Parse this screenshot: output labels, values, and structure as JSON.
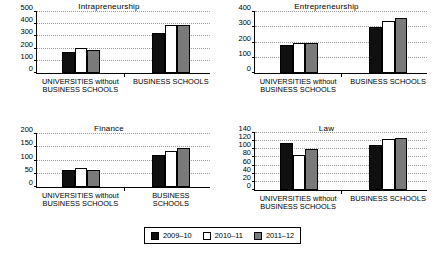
{
  "legend": {
    "items": [
      {
        "label": "2009–10",
        "color": "#101010"
      },
      {
        "label": "2010–11",
        "color": "#ffffff"
      },
      {
        "label": "2011–12",
        "color": "#7a7a7a"
      }
    ]
  },
  "chart_data": [
    {
      "type": "bar",
      "title": "Intrapreneurship",
      "categories": [
        "UNIVERSITIES without\nBUSINESS SCHOOLS",
        "BUSINESS SCHOOLS"
      ],
      "series": [
        {
          "name": "2009–10",
          "values": [
            175,
            330
          ]
        },
        {
          "name": "2010–11",
          "values": [
            207,
            395
          ]
        },
        {
          "name": "2011–12",
          "values": [
            188,
            395
          ]
        }
      ],
      "xlabel": "",
      "ylabel": "",
      "ylim": [
        0,
        500
      ],
      "yticks": [
        0,
        100,
        200,
        300,
        400,
        500
      ],
      "grid": true,
      "legend_position": "bottom-center"
    },
    {
      "type": "bar",
      "title": "Entrepreneurship",
      "categories": [
        "UNIVERSITIES without\nBUSINESS SCHOOLS",
        "BUSINESS SCHOOLS"
      ],
      "series": [
        {
          "name": "2009–10",
          "values": [
            183,
            303
          ]
        },
        {
          "name": "2010–11",
          "values": [
            198,
            338
          ]
        },
        {
          "name": "2011–12",
          "values": [
            197,
            362
          ]
        }
      ],
      "xlabel": "",
      "ylabel": "",
      "ylim": [
        0,
        400
      ],
      "yticks": [
        0,
        100,
        200,
        300,
        400
      ],
      "grid": true,
      "legend_position": "bottom-center"
    },
    {
      "type": "bar",
      "title": "Finance",
      "categories": [
        "UNIVERSITIES without\nBUSINESS SCHOOLS",
        "BUSINESS\nSCHOOLS"
      ],
      "series": [
        {
          "name": "2009–10",
          "values": [
            66,
            120
          ]
        },
        {
          "name": "2010–11",
          "values": [
            71,
            135
          ]
        },
        {
          "name": "2011–12",
          "values": [
            63,
            147
          ]
        }
      ],
      "xlabel": "",
      "ylabel": "",
      "ylim": [
        0,
        200
      ],
      "yticks": [
        0,
        50,
        100,
        150,
        200
      ],
      "grid": true,
      "legend_position": "bottom-center"
    },
    {
      "type": "bar",
      "title": "Law",
      "categories": [
        "UNIVERSITIES without\nBUSINESS SCHOOLS",
        "BUSINESS SCHOOLS"
      ],
      "series": [
        {
          "name": "2009–10",
          "values": [
            115,
            110
          ]
        },
        {
          "name": "2010–11",
          "values": [
            85,
            125
          ]
        },
        {
          "name": "2011–12",
          "values": [
            101,
            128
          ]
        }
      ],
      "xlabel": "",
      "ylabel": "",
      "ylim": [
        0,
        140
      ],
      "yticks": [
        0,
        20,
        40,
        60,
        80,
        100,
        120,
        140
      ],
      "grid": true,
      "legend_position": "bottom-center"
    }
  ]
}
